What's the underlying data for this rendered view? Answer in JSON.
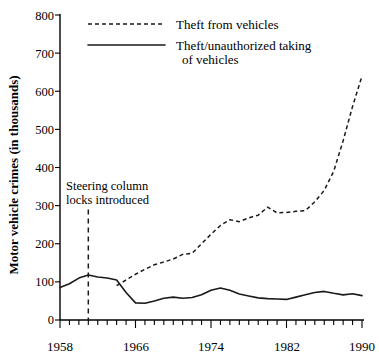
{
  "chart_data": {
    "type": "line",
    "title": "",
    "subtitle": "",
    "xlabel": "",
    "ylabel": "Motor vehicle crimes (in thousands)",
    "xlim": [
      1958,
      1990
    ],
    "ylim": [
      0,
      800
    ],
    "grid": false,
    "legend_position": "top-center",
    "x_tick_labels": [
      "1958",
      "1966",
      "1974",
      "1982",
      "1990"
    ],
    "x_tick_values": [
      1958,
      1966,
      1974,
      1982,
      1990
    ],
    "x_minor_tick_step": 1,
    "y_tick_labels": [
      "0",
      "100",
      "200",
      "300",
      "400",
      "500",
      "600",
      "700",
      "800"
    ],
    "y_tick_values": [
      0,
      100,
      200,
      300,
      400,
      500,
      600,
      700,
      800
    ],
    "annotations": [
      {
        "name": "steering-column-locks",
        "text_line1": "Steering column",
        "text_line2": "locks introduced",
        "x": 1961,
        "marker": "vertical-dashed-line",
        "line_top_value": 290,
        "line_bottom_value": 0
      }
    ],
    "series": [
      {
        "name": "Theft from vehicles",
        "style": "dashed",
        "color": "#1a1a1a",
        "x": [
          1964,
          1965,
          1966,
          1967,
          1968,
          1969,
          1970,
          1971,
          1972,
          1973,
          1974,
          1975,
          1976,
          1977,
          1978,
          1979,
          1980,
          1981,
          1982,
          1983,
          1984,
          1985,
          1986,
          1987,
          1988,
          1989,
          1990
        ],
        "values": [
          90,
          105,
          120,
          133,
          145,
          152,
          160,
          172,
          175,
          200,
          225,
          248,
          263,
          258,
          268,
          275,
          296,
          281,
          282,
          285,
          287,
          310,
          340,
          390,
          470,
          560,
          640
        ],
        "values_note": "dashed series 1964-1990"
      },
      {
        "name": "Theft/unauthorized taking of vehicles",
        "style": "solid",
        "color": "#1a1a1a",
        "x": [
          1958,
          1959,
          1960,
          1961,
          1962,
          1963,
          1964,
          1965,
          1966,
          1967,
          1968,
          1969,
          1970,
          1971,
          1972,
          1973,
          1974,
          1975,
          1976,
          1977,
          1978,
          1979,
          1980,
          1981,
          1982,
          1983,
          1984,
          1985,
          1986,
          1987,
          1988,
          1989,
          1990
        ],
        "values": [
          85,
          95,
          110,
          118,
          113,
          110,
          105,
          72,
          45,
          44,
          50,
          57,
          60,
          57,
          59,
          66,
          78,
          84,
          78,
          68,
          63,
          58,
          56,
          55,
          54,
          60,
          66,
          72,
          75,
          70,
          66,
          69,
          64
        ],
        "values_note": "solid series 1958-1990"
      }
    ]
  },
  "legend": {
    "entries": [
      {
        "label": "Theft from vehicles",
        "style": "dashed"
      },
      {
        "label": "Theft/unauthorized taking",
        "label_line2": "of vehicles",
        "style": "solid"
      }
    ]
  },
  "axes": {
    "y_axis_title": "Motor vehicle crimes (in thousands)"
  }
}
